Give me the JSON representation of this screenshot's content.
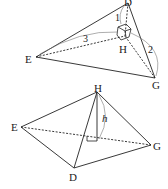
{
  "figure1": {
    "vertices": {
      "D": "D",
      "E": "E",
      "G": "G",
      "H": "H"
    },
    "edge_labels": {
      "DH": "1",
      "EH": "3",
      "GH": "2"
    }
  },
  "figure2": {
    "vertices": {
      "H": "H",
      "E": "E",
      "G": "G",
      "D": "D"
    },
    "height_label": "h"
  },
  "colors": {
    "stroke": "#222222",
    "arc": "#777777",
    "background": "#ffffff"
  }
}
